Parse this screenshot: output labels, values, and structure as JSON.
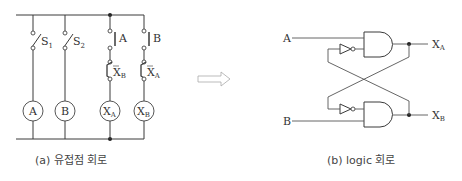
{
  "left_circuit": {
    "caption": "(a) 유접점 회로",
    "switches": [
      {
        "label": "S",
        "sub": "1"
      },
      {
        "label": "S",
        "sub": "2"
      }
    ],
    "contacts": [
      {
        "label": "A",
        "type": "no"
      },
      {
        "label": "B",
        "type": "no"
      },
      {
        "label": "X",
        "sub": "B",
        "type": "nc"
      },
      {
        "label": "X",
        "sub": "A",
        "type": "nc"
      }
    ],
    "coils": [
      {
        "label": "A"
      },
      {
        "label": "B"
      },
      {
        "label": "X",
        "sub": "A"
      },
      {
        "label": "X",
        "sub": "B"
      }
    ]
  },
  "arrow": {
    "direction": "right",
    "name": "hollow-arrow"
  },
  "right_circuit": {
    "caption": "(b) logic 회로",
    "inputs": [
      {
        "label": "A"
      },
      {
        "label": "B"
      }
    ],
    "outputs": [
      {
        "label": "X",
        "sub": "A"
      },
      {
        "label": "X",
        "sub": "B"
      }
    ],
    "gates": [
      "AND",
      "AND",
      "NOT",
      "NOT"
    ]
  }
}
